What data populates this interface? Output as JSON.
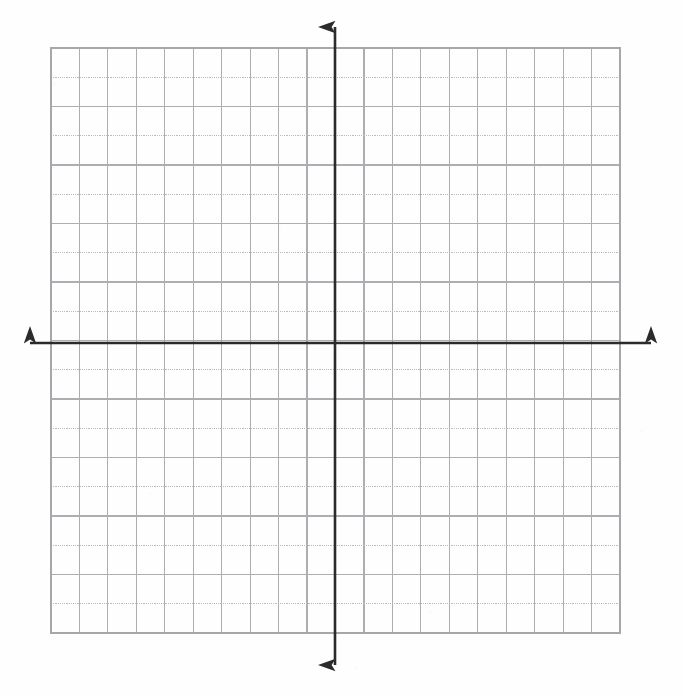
{
  "document": {
    "kind": "blank-cartesian-coordinate-grid",
    "title": "Blank Coordinate Plane Grid",
    "background_color": "#fefefe"
  },
  "chart_data": {
    "type": "scatter",
    "title": "",
    "subtitle": "",
    "xlabel": "",
    "ylabel": "",
    "series": [
      {
        "name": "plotted-points",
        "x": [],
        "y": []
      }
    ],
    "x": [],
    "values": [],
    "categories": [],
    "xlim": [
      -10,
      10
    ],
    "ylim": [
      -10,
      10
    ],
    "xticks": [
      -10,
      -9,
      -8,
      -7,
      -6,
      -5,
      -4,
      -3,
      -2,
      -1,
      0,
      1,
      2,
      3,
      4,
      5,
      6,
      7,
      8,
      9,
      10
    ],
    "yticks": [
      -10,
      -9,
      -8,
      -7,
      -6,
      -5,
      -4,
      -3,
      -2,
      -1,
      0,
      1,
      2,
      3,
      4,
      5,
      6,
      7,
      8,
      9,
      10
    ],
    "xtick_labels": [],
    "ytick_labels": [],
    "legend": [],
    "legend_position": "none",
    "annotations": [],
    "grid": true,
    "grid_columns": 20,
    "grid_rows": 20
  },
  "geometry": {
    "grid_left": 51,
    "grid_top": 48,
    "grid_right": 620,
    "grid_bottom": 633,
    "cell_width": 28.45,
    "cell_height": 29.25,
    "origin_x": 335,
    "origin_y": 343,
    "axis_x_start": 30,
    "axis_x_end": 651,
    "axis_y_start": 27,
    "axis_y_end": 665,
    "columns": 20,
    "rows": 20
  },
  "style": {
    "axis_color": "#2b2b2b",
    "axis_width": 2.6,
    "grid_line_color": "#adadb2",
    "grid_line_alt_color": "#b9b9be",
    "grid_line_width": 1.15,
    "grid_border_color": "#a6a6ab",
    "arrowhead_color": "#2b2b2b"
  },
  "axes": {
    "x_axis_name": "horizontal-axis",
    "y_axis_name": "vertical-axis",
    "x_axis_label": "",
    "y_axis_label": "",
    "arrow_left_name": "x-axis-left-arrowhead",
    "arrow_right_name": "x-axis-right-arrowhead",
    "arrow_up_name": "y-axis-up-arrowhead",
    "arrow_down_name": "y-axis-down-arrowhead"
  }
}
